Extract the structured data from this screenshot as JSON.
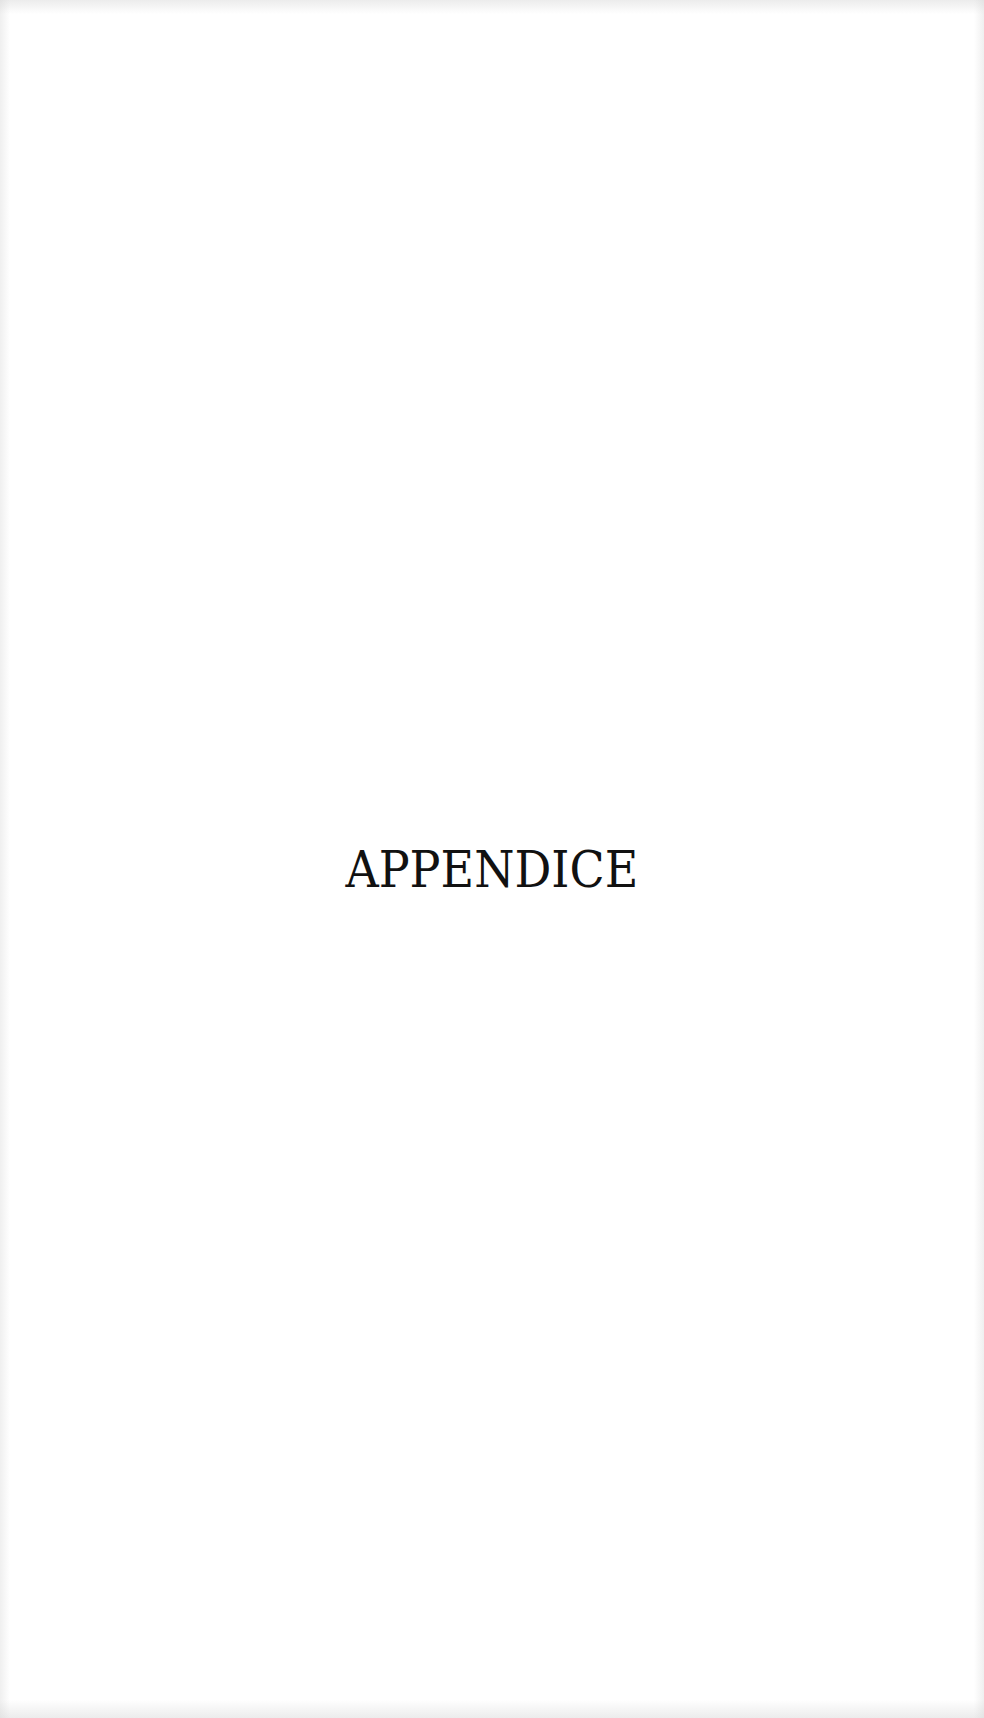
{
  "page": {
    "heading": "APPENDICE",
    "background_color": "#ffffff",
    "text_color": "#111111"
  }
}
